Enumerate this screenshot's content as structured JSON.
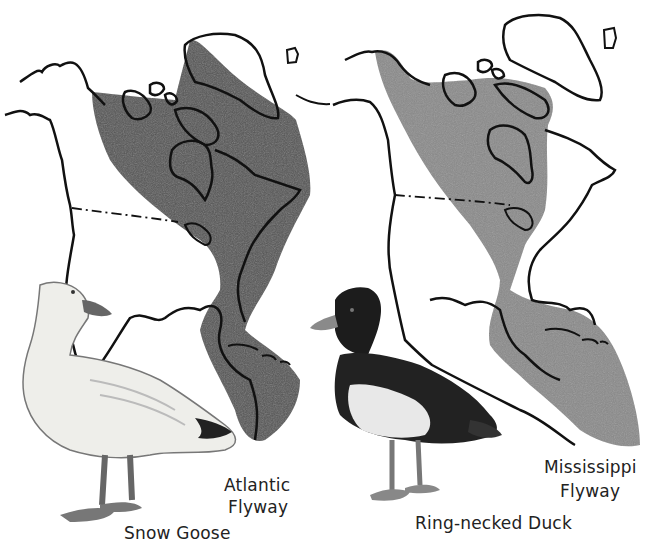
{
  "figure": {
    "panels": [
      {
        "id": "atlantic",
        "flyway_label_line1": "Atlantic",
        "flyway_label_line2": "Flyway",
        "bird_label": "Snow Goose",
        "range_color": "#555555"
      },
      {
        "id": "mississippi",
        "flyway_label_line1": "Mississippi",
        "flyway_label_line2": "Flyway",
        "bird_label": "Ring-necked Duck",
        "range_color": "#8a8a8a"
      }
    ],
    "colors": {
      "background": "#ffffff",
      "outline": "#111111",
      "text": "#222222"
    }
  }
}
